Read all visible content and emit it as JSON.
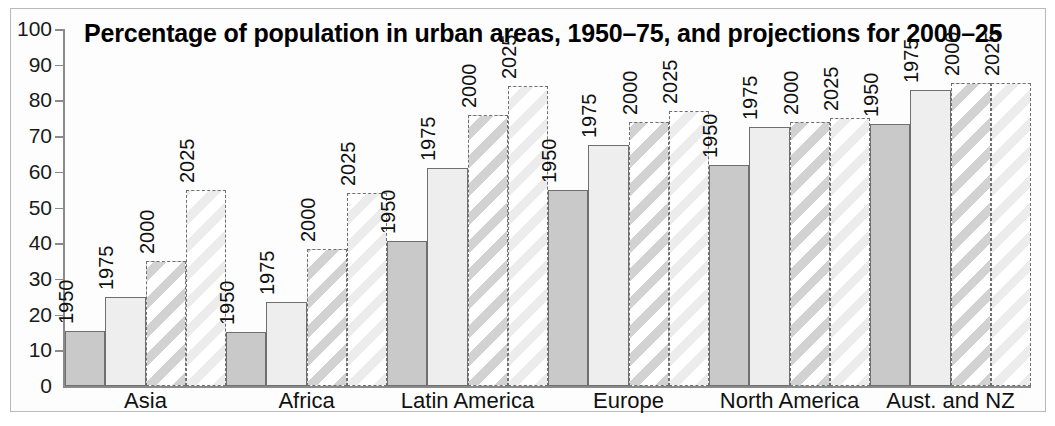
{
  "chart_data": {
    "type": "bar",
    "title": "Percentage of population in urban areas, 1950–75, and projections for 2000–25",
    "xlabel": "",
    "ylabel": "",
    "ylim": [
      0,
      100
    ],
    "ytick_labels": [
      "100",
      "90",
      "80",
      "70",
      "60",
      "50",
      "40",
      "30",
      "20",
      "10",
      "0"
    ],
    "yticks": [
      100,
      90,
      80,
      70,
      60,
      50,
      40,
      30,
      20,
      10,
      0
    ],
    "grid": false,
    "legend": "none (bars labelled individually)",
    "categories": [
      "Asia",
      "Africa",
      "Latin America",
      "Europe",
      "North America",
      "Aust. and NZ"
    ],
    "series": [
      {
        "name": "1950",
        "style": "solid-grey",
        "values": [
          15.3,
          15.2,
          40.5,
          55.0,
          62.0,
          73.5
        ]
      },
      {
        "name": "1975",
        "style": "light-grey",
        "values": [
          25.0,
          23.5,
          61.0,
          67.5,
          72.5,
          83.0
        ]
      },
      {
        "name": "2000",
        "style": "dashed-hatch-dark",
        "values": [
          35.0,
          38.5,
          76.0,
          74.0,
          74.0,
          85.0
        ]
      },
      {
        "name": "2025",
        "style": "dashed-hatch-light",
        "values": [
          55.0,
          54.0,
          84.0,
          77.0,
          75.0,
          85.0
        ]
      }
    ],
    "bar_labels": [
      "1950",
      "1975",
      "2000",
      "2025"
    ]
  },
  "colors": {
    "bar_1950": "#c9c9c9",
    "bar_1975": "#eeeeee",
    "hatch_2000": "#d2d2d2",
    "hatch_2025": "#ececec",
    "outline": "#6f6f6f",
    "axis": "#8a8a8a",
    "text": "#111111",
    "frame": "#b9b9b9",
    "background": "#ffffff"
  }
}
